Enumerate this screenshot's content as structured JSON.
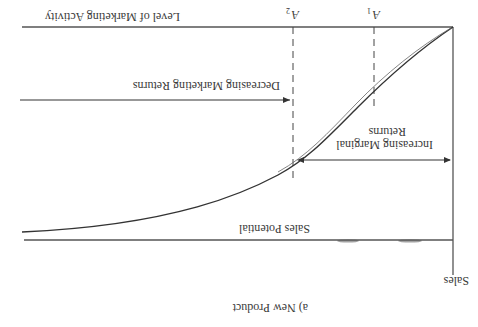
{
  "figure": {
    "caption": "a)  New Product",
    "orientation": "rotated 180 degrees",
    "y_axis_label": "Sales",
    "x_axis_label": "Level of Marketing Activity",
    "reference_line_label": "Sales Potential",
    "markers": [
      {
        "label": "A",
        "subscript": "1"
      },
      {
        "label": "A",
        "subscript": "2"
      }
    ],
    "annotations": {
      "increasing_line1": "Increasing Marginal",
      "increasing_line2": "Returns",
      "decreasing": "Decreasing Marketing Returns"
    },
    "colors": {
      "line": "#333333",
      "text": "#3a3a3a",
      "background": "#ffffff"
    }
  }
}
